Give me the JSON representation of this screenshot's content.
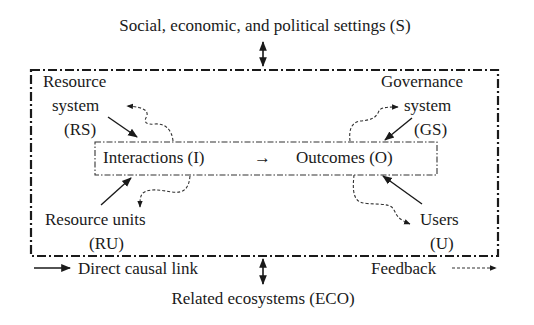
{
  "diagram": {
    "title_top": "Social, economic, and political settings (S)",
    "title_bottom": "Related ecosystems (ECO)",
    "nodes": {
      "resource_system": {
        "line1": "Resource",
        "line2": "system",
        "line3": "(RS)"
      },
      "governance_system": {
        "line1": "Governance",
        "line2": "system",
        "line3": "(GS)"
      },
      "resource_units": {
        "line1": "Resource units",
        "line2": "(RU)"
      },
      "users": {
        "line1": "Users",
        "line2": "(U)"
      },
      "interactions": "Interactions (I)",
      "arrow_glyph": "→",
      "outcomes": "Outcomes (O)"
    },
    "legend": {
      "direct_causal_link": "Direct causal link",
      "feedback": "Feedback"
    },
    "colors": {
      "line": "#1a1a1a",
      "background": "#ffffff"
    }
  }
}
